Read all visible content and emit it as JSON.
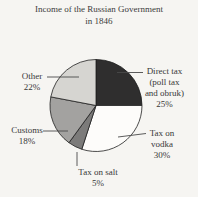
{
  "header": {
    "title_line1": "Income of the Russian Government",
    "title_line2": "in 1846"
  },
  "chart_data": {
    "type": "pie",
    "title": "Income of the Russian Government in 1846",
    "unit": "%",
    "direction": "clockwise",
    "start_angle_deg_from_top": 0,
    "legend": "none",
    "labels_position": "outside-with-leader-lines",
    "slices": [
      {
        "label": "Direct tax (poll tax and obruk)",
        "pct": 25,
        "color": "#2f2e2e"
      },
      {
        "label": "Tax on vodka",
        "pct": 30,
        "color": "#fdfcfa"
      },
      {
        "label": "Tax on salt",
        "pct": 5,
        "color": "#7c7b7a"
      },
      {
        "label": "Customs",
        "pct": 18,
        "color": "#a3a2a0"
      },
      {
        "label": "Other",
        "pct": 22,
        "color": "#d6d5d1"
      }
    ]
  },
  "callouts": {
    "other": {
      "l1": "Other",
      "l2": "22%"
    },
    "customs": {
      "l1": "Customs",
      "l2": "18%"
    },
    "direct": {
      "l1": "Direct tax",
      "l2": "(poll tax",
      "l3": "and obruk)",
      "l4": "25%"
    },
    "vodka": {
      "l1": "Tax on",
      "l2": "vodka",
      "l3": "30%"
    },
    "salt": {
      "l1": "Tax on salt",
      "l2": "5%"
    }
  },
  "style": {
    "outline_color": "#1f1f1f",
    "leader_line_color": "#4a4a4a",
    "background_color": "#f6f5f2"
  }
}
